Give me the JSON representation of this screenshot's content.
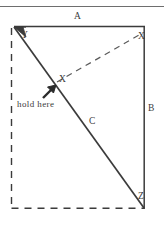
{
  "figure": {
    "ink_color": "#3b3b3b",
    "background_color": "#ffffff",
    "labels": {
      "top_edge": "A",
      "right_edge": "B",
      "diagonal_fold": "C",
      "corner_top_left": "Y",
      "corner_top_right": "X",
      "point_inner": "X",
      "corner_bottom_right": "Z",
      "instruction": "hold here"
    },
    "icons": {
      "grip_arrow": "arrow-up-right-icon",
      "corner_arrow": "arrow-up-left-icon"
    }
  }
}
